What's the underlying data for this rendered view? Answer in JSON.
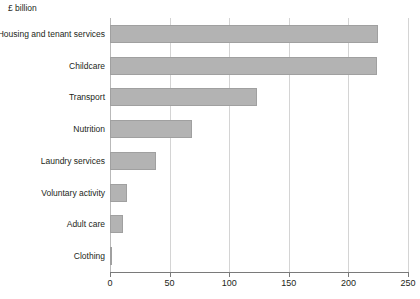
{
  "chart": {
    "unit_caption": "£ billion"
  },
  "chart_data": {
    "type": "bar",
    "orientation": "horizontal",
    "title": "",
    "subtitle": "",
    "xlabel": "£ billion",
    "ylabel": "",
    "xlim": [
      0,
      250
    ],
    "xticks": [
      0,
      50,
      100,
      150,
      200,
      250
    ],
    "xtick_labels": [
      "0",
      "50",
      "100",
      "150",
      "200",
      "250"
    ],
    "grid": "vertical",
    "legend": "none",
    "bar_color": "#b3b3b3",
    "bar_border_color": "#a0a0a0",
    "gridline_color": "#d4d4d4",
    "axis_color": "#7a7a7a",
    "text_color": "#231f20",
    "categories": [
      "Housing and tenant services",
      "Childcare",
      "Transport",
      "Nutrition",
      "Laundry services",
      "Voluntary activity",
      "Adult care",
      "Clothing"
    ],
    "values": [
      225,
      224,
      123,
      69,
      39,
      14,
      11,
      1
    ]
  }
}
